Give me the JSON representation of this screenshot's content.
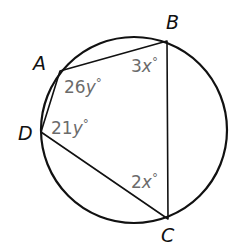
{
  "figure": {
    "type": "inscribed-quadrilateral",
    "colors": {
      "stroke": "#111111",
      "vertex_label": "#111111",
      "angle_label": "#6b6b6b",
      "background": "#ffffff"
    },
    "circle": {
      "cx": 134,
      "cy": 130,
      "r": 93
    },
    "vertices": {
      "A": {
        "label": "A",
        "x": 60,
        "y": 71
      },
      "B": {
        "label": "B",
        "x": 167,
        "y": 41
      },
      "C": {
        "label": "C",
        "x": 168,
        "y": 219
      },
      "D": {
        "label": "D",
        "x": 41,
        "y": 132
      }
    },
    "angles": {
      "A": {
        "coef": "26",
        "var": "y",
        "deg": "°"
      },
      "B": {
        "coef": "3",
        "var": "x",
        "deg": "°"
      },
      "C": {
        "coef": "2",
        "var": "x",
        "deg": "°"
      },
      "D": {
        "coef": "21",
        "var": "y",
        "deg": "°"
      }
    }
  }
}
